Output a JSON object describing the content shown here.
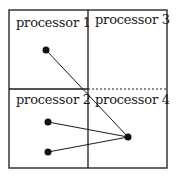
{
  "diagram": {
    "cells": [
      {
        "id": "p1",
        "label": "processor 1"
      },
      {
        "id": "p2",
        "label": "processor 2"
      },
      {
        "id": "p3",
        "label": "processor 3"
      },
      {
        "id": "p4",
        "label": "processor 4"
      }
    ],
    "nodes": [
      {
        "cell": "processor 1",
        "x": 46,
        "y": 50
      },
      {
        "cell": "processor 2",
        "x": 48,
        "y": 122
      },
      {
        "cell": "processor 2",
        "x": 48,
        "y": 152
      },
      {
        "cell": "processor 4",
        "x": 128,
        "y": 137
      }
    ],
    "edges": [
      {
        "from": 0,
        "to": 3
      },
      {
        "from": 1,
        "to": 3
      },
      {
        "from": 2,
        "to": 3
      }
    ],
    "dashed_boundary": "between processor 3 and processor 4"
  }
}
